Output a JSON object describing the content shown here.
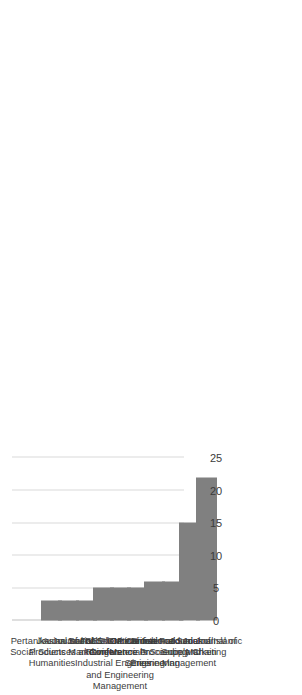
{
  "chart_data": {
    "type": "bar",
    "orientation": "horizontal",
    "title": "",
    "subtitle": "",
    "xlabel": "",
    "ylabel": "",
    "xlim": [
      0,
      25
    ],
    "xticks": [
      "0",
      "5",
      "10",
      "15",
      "20",
      "25"
    ],
    "grid": true,
    "legend": null,
    "legend_position": "none",
    "bar_color": "#808080",
    "gridline_color": "#d9d9d9",
    "axis_color": "#bfbfbf",
    "text_color": "#3b3b3b",
    "categories": [
      "Pertanika Journal of Social Sciences and Humanities",
      "Journal of Food Products Marketing",
      "Asian Social Science",
      "Journal of Critical Reviews",
      "IEEE International Conference on Industrial Engineering and Engineering Management",
      "ACM International Conference Proceeding Series",
      "IOP Conference Series Materials Science and Engineering",
      "British Food Journal",
      "International Journal of Supply Chain Management",
      "Journal of Islamic Marketing"
    ],
    "values": [
      3,
      3,
      3,
      5,
      5,
      5,
      6,
      6,
      15,
      22
    ]
  }
}
